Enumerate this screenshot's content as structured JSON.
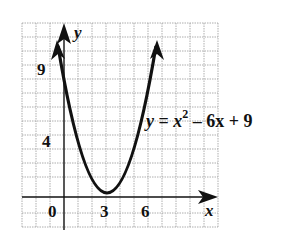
{
  "graph": {
    "equation": {
      "y": "y",
      "eq": " = ",
      "x": "x",
      "exp": "2",
      "rest": " – 6x + 9"
    },
    "axis_labels": {
      "x": "x",
      "y": "y"
    },
    "ticks": {
      "x0": "0",
      "x3": "3",
      "x6": "6",
      "y4": "4",
      "y9": "9"
    },
    "colors": {
      "curve": "#111111",
      "grid": "#999999"
    }
  }
}
